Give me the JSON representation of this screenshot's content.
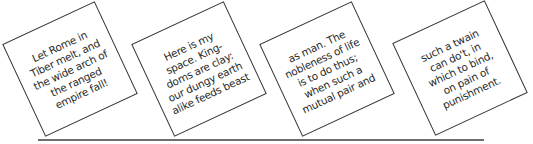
{
  "cards": [
    {
      "lines": [
        "Let Rome in",
        "Tiber melt, and",
        "the wide arch of",
        "the ranged",
        "empire fall!"
      ]
    },
    {
      "lines": [
        "Here is my",
        "space. King-",
        "doms are clay:",
        "our dungy earth",
        "alike feeds beast"
      ]
    },
    {
      "lines": [
        "as man. The",
        "nobleness of life",
        "is to do thus;",
        "when such a",
        "mutual pair and"
      ]
    },
    {
      "lines": [
        "such a twain",
        "can do't, in",
        "which to bind,",
        "on pain of",
        "punishment."
      ]
    }
  ],
  "colors": {
    "card_border": "#333333",
    "text": "#2a2a2a",
    "rule": "#6e6e6e",
    "background": "#ffffff"
  }
}
